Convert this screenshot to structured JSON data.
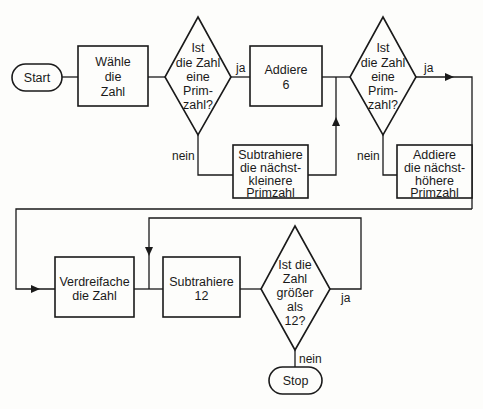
{
  "diagram": {
    "type": "flowchart",
    "nodes": {
      "start": {
        "label": "Start"
      },
      "choose": {
        "lines": [
          "Wähle",
          "die",
          "Zahl"
        ]
      },
      "prime1": {
        "lines": [
          "Ist",
          "die Zahl",
          "eine",
          "Prim-",
          "zahl?"
        ]
      },
      "add6": {
        "lines": [
          "Addiere",
          "6"
        ]
      },
      "sub_prev_prime": {
        "lines": [
          "Subtrahiere",
          "die nächst-",
          "kleinere",
          "Primzahl"
        ]
      },
      "prime2": {
        "lines": [
          "Ist",
          "die Zahl",
          "eine",
          "Prim-",
          "zahl?"
        ]
      },
      "add_next_prime": {
        "lines": [
          "Addiere",
          "die nächst-",
          "höhere",
          "Primzahl"
        ]
      },
      "triple": {
        "lines": [
          "Verdreifache",
          "die Zahl"
        ]
      },
      "sub12": {
        "lines": [
          "Subtrahiere",
          "12"
        ]
      },
      "gt12": {
        "lines": [
          "Ist die",
          "Zahl",
          "größer",
          "als",
          "12?"
        ]
      },
      "stop": {
        "label": "Stop"
      }
    },
    "edge_labels": {
      "prime1_yes": "ja",
      "prime1_no": "nein",
      "prime2_yes": "ja",
      "prime2_no": "nein",
      "gt12_yes": "ja",
      "gt12_no": "nein"
    },
    "edges": [
      [
        "start",
        "choose"
      ],
      [
        "choose",
        "prime1"
      ],
      [
        "prime1",
        "add6",
        "ja"
      ],
      [
        "prime1",
        "sub_prev_prime",
        "nein"
      ],
      [
        "sub_prev_prime",
        "prime2"
      ],
      [
        "add6",
        "prime2"
      ],
      [
        "prime2",
        "triple",
        "ja"
      ],
      [
        "prime2",
        "add_next_prime",
        "nein"
      ],
      [
        "add_next_prime",
        "triple"
      ],
      [
        "triple",
        "sub12"
      ],
      [
        "sub12",
        "gt12"
      ],
      [
        "gt12",
        "sub12",
        "ja"
      ],
      [
        "gt12",
        "stop",
        "nein"
      ]
    ]
  }
}
